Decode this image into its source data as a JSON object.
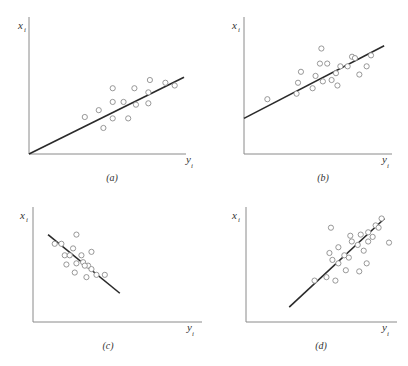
{
  "chart_data": [
    {
      "type": "scatter",
      "panel": "a",
      "caption": "(a)",
      "xlabel": "y",
      "xlabel_sub": "i",
      "ylabel": "x",
      "ylabel_sub": "i",
      "xlim": [
        0,
        10
      ],
      "ylim": [
        0,
        10
      ],
      "grid": false,
      "points": [
        [
          3.6,
          2.7
        ],
        [
          4.5,
          3.2
        ],
        [
          5.4,
          4.8
        ],
        [
          5.4,
          3.8
        ],
        [
          4.8,
          1.9
        ],
        [
          5.4,
          2.6
        ],
        [
          6.1,
          3.8
        ],
        [
          6.4,
          2.6
        ],
        [
          6.8,
          4.8
        ],
        [
          6.9,
          3.6
        ],
        [
          7.7,
          3.7
        ],
        [
          7.7,
          4.5
        ],
        [
          7.8,
          5.4
        ],
        [
          8.8,
          5.2
        ],
        [
          9.4,
          5.0
        ]
      ],
      "fit_line": [
        [
          0,
          0
        ],
        [
          10,
          5.6
        ]
      ]
    },
    {
      "type": "scatter",
      "panel": "b",
      "caption": "(b)",
      "xlabel": "y",
      "xlabel_sub": "i",
      "ylabel": "x",
      "ylabel_sub": "i",
      "xlim": [
        0,
        10
      ],
      "ylim": [
        0,
        10
      ],
      "grid": false,
      "points": [
        [
          1.6,
          4.0
        ],
        [
          3.6,
          4.4
        ],
        [
          3.7,
          5.2
        ],
        [
          3.9,
          6.0
        ],
        [
          4.7,
          4.8
        ],
        [
          4.9,
          5.7
        ],
        [
          5.2,
          6.6
        ],
        [
          5.3,
          7.7
        ],
        [
          5.4,
          5.3
        ],
        [
          5.7,
          6.6
        ],
        [
          6.0,
          5.4
        ],
        [
          6.3,
          5.9
        ],
        [
          6.4,
          5.0
        ],
        [
          6.6,
          6.4
        ],
        [
          7.1,
          6.4
        ],
        [
          7.4,
          7.1
        ],
        [
          7.9,
          5.8
        ],
        [
          7.6,
          7.0
        ],
        [
          8.7,
          7.2
        ],
        [
          8.4,
          6.4
        ]
      ],
      "fit_line": [
        [
          0,
          2.6
        ],
        [
          9.6,
          7.9
        ]
      ]
    },
    {
      "type": "scatter",
      "panel": "c",
      "caption": "(c)",
      "xlabel": "y",
      "xlabel_sub": "i",
      "ylabel": "x",
      "ylabel_sub": "i",
      "xlim": [
        0,
        10
      ],
      "ylim": [
        0,
        10
      ],
      "grid": false,
      "points": [
        [
          1.3,
          6.8
        ],
        [
          1.7,
          6.8
        ],
        [
          2.6,
          7.6
        ],
        [
          2.4,
          6.4
        ],
        [
          1.9,
          5.8
        ],
        [
          2.2,
          5.8
        ],
        [
          2.9,
          5.8
        ],
        [
          3.5,
          6.1
        ],
        [
          2.6,
          5.1
        ],
        [
          3.0,
          5.2
        ],
        [
          3.3,
          4.9
        ],
        [
          2.0,
          5.0
        ],
        [
          3.1,
          4.9
        ],
        [
          2.5,
          4.3
        ],
        [
          3.5,
          4.6
        ],
        [
          3.8,
          4.1
        ],
        [
          4.3,
          4.1
        ],
        [
          3.2,
          3.9
        ]
      ],
      "fit_line": [
        [
          0.9,
          7.6
        ],
        [
          5.2,
          2.5
        ]
      ]
    },
    {
      "type": "scatter",
      "panel": "d",
      "caption": "(d)",
      "xlabel": "y",
      "xlabel_sub": "i",
      "ylabel": "x",
      "ylabel_sub": "i",
      "xlim": [
        0,
        10
      ],
      "ylim": [
        0,
        10
      ],
      "grid": false,
      "points": [
        [
          5.7,
          8.2
        ],
        [
          5.6,
          6.0
        ],
        [
          5.8,
          5.4
        ],
        [
          6.2,
          6.5
        ],
        [
          6.2,
          5.1
        ],
        [
          6.6,
          5.8
        ],
        [
          6.7,
          4.5
        ],
        [
          6.9,
          5.6
        ],
        [
          7.0,
          7.5
        ],
        [
          7.1,
          7.0
        ],
        [
          7.5,
          6.7
        ],
        [
          7.7,
          7.6
        ],
        [
          7.9,
          6.2
        ],
        [
          8.1,
          5.1
        ],
        [
          8.2,
          7.8
        ],
        [
          8.2,
          7.0
        ],
        [
          8.5,
          7.4
        ],
        [
          8.7,
          8.4
        ],
        [
          8.9,
          8.2
        ],
        [
          9.1,
          9.0
        ],
        [
          9.6,
          6.9
        ],
        [
          5.4,
          3.9
        ],
        [
          4.6,
          3.6
        ],
        [
          6.0,
          3.6
        ],
        [
          7.6,
          4.4
        ]
      ],
      "fit_line": [
        [
          2.9,
          1.3
        ],
        [
          9.3,
          9.0
        ]
      ]
    }
  ]
}
